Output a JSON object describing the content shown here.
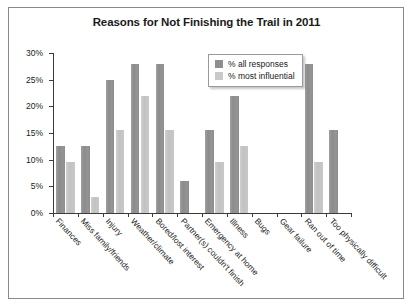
{
  "chart_data": {
    "type": "bar",
    "title": "Reasons for Not Finishing the Trail in 2011",
    "xlabel": "",
    "ylabel": "",
    "ylim": [
      0,
      30
    ],
    "ytick_labels": [
      "0%",
      "5%",
      "10%",
      "15%",
      "20%",
      "25%",
      "30%"
    ],
    "ytick_values": [
      0,
      5,
      10,
      15,
      20,
      25,
      30
    ],
    "grid": false,
    "legend_position": "top-right",
    "categories": [
      "Finances",
      "Miss family/friends",
      "Injury",
      "Weather/climate",
      "Bored/lost interest",
      "Partner(s) couldn't finish",
      "Emergency at home",
      "Illness",
      "Bugs",
      "Gear failure",
      "Ran out of time",
      "Too physically difficult"
    ],
    "series": [
      {
        "name": "% all responses",
        "color": "#8e8e8e",
        "values": [
          12.5,
          12.5,
          25,
          28,
          28,
          6,
          15.5,
          22,
          0,
          0,
          28,
          15.5
        ]
      },
      {
        "name": "% most influential",
        "color": "#c9c9c9",
        "values": [
          9.5,
          3,
          15.5,
          22,
          15.5,
          0,
          9.5,
          12.5,
          0,
          0,
          9.5,
          0
        ]
      }
    ]
  },
  "legend": {
    "items": [
      {
        "label": "% all responses"
      },
      {
        "label": "% most influential"
      }
    ]
  }
}
